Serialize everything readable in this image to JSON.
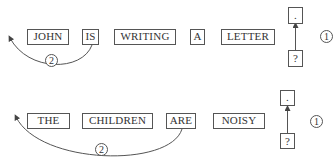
{
  "rows": [
    {
      "words": [
        "JOHN",
        "IS",
        "WRITING",
        "A",
        "LETTER"
      ],
      "top_box": ".",
      "bottom_box": "?",
      "step_right": "1",
      "step_curve": "2"
    },
    {
      "words": [
        "THE",
        "CHILDREN",
        "ARE",
        "NOISY"
      ],
      "top_box": ".",
      "bottom_box": "?",
      "step_right": "1",
      "step_curve": "2"
    }
  ]
}
